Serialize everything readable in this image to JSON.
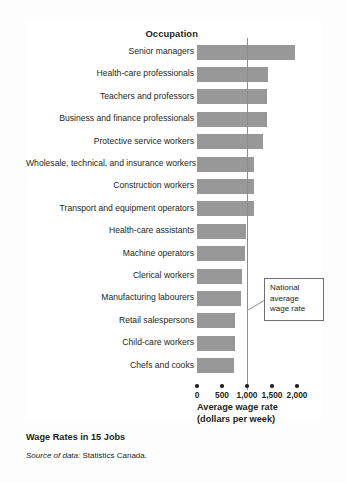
{
  "figure": {
    "title": "Wage Rates in 15 Jobs",
    "source_lead": "Source of data:",
    "source_text": " Statistics Canada."
  },
  "column_header": "Occupation",
  "annotation": {
    "line1": "National",
    "line2": "average",
    "line3": "wage rate"
  },
  "axis": {
    "title_line1": "Average wage rate",
    "title_line2": "(dollars per week)",
    "ticks": [
      "0",
      "500",
      "1,000",
      "1,500",
      "2,000"
    ]
  },
  "colors": {
    "bar": "#989898",
    "average_line": "#8d8d8d",
    "text": "#231f20",
    "panel": "#ffffff"
  },
  "chart_data": {
    "type": "bar",
    "orientation": "horizontal",
    "title": "Wage Rates in 15 Jobs",
    "xlabel": "Average wage rate (dollars per week)",
    "ylabel": "Occupation",
    "xlim": [
      0,
      2000
    ],
    "xticks": [
      0,
      500,
      1000,
      1500,
      2000
    ],
    "grid": false,
    "legend": false,
    "reference_line": {
      "label": "National average wage rate",
      "value": 1000
    },
    "categories": [
      "Senior managers",
      "Health-care professionals",
      "Teachers and professors",
      "Business and finance professionals",
      "Protective service workers",
      "Wholesale, technical, and insurance workers",
      "Construction workers",
      "Transport and equipment operators",
      "Health-care assistants",
      "Machine operators",
      "Clerical workers",
      "Manufacturing labourers",
      "Retail salespersons",
      "Child-care workers",
      "Chefs and cooks"
    ],
    "values": [
      1950,
      1420,
      1400,
      1400,
      1320,
      1140,
      1140,
      1130,
      980,
      960,
      900,
      880,
      760,
      750,
      740
    ]
  }
}
